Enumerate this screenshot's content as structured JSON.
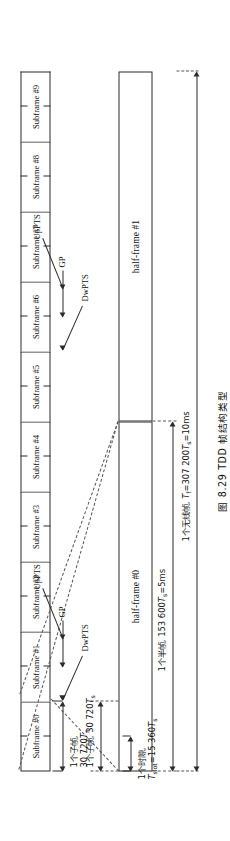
{
  "figure": {
    "caption_number": "图 8.29",
    "caption_title": "TDD 帧结构类型",
    "caption_full": "图 8.29  TDD 帧结构类型"
  },
  "dimensions": {
    "radio_frame": {
      "name_cn": "1个无线帧",
      "value": "Tf=307 200Ts=10ms",
      "value_prefix": "T",
      "value_sub": "f",
      "value_rest": "=307 200",
      "unit_sym": "T",
      "unit_sub": "s",
      "unit_tail": "=10ms",
      "full": "1个无线帧,Tf=307 200Ts=10ms"
    },
    "half_frame": {
      "name_cn": "1个半帧",
      "value_rest": "153 600",
      "unit_sym": "T",
      "unit_sub": "s",
      "unit_tail": "=5ms",
      "full": "1个半帧,153 600Ts=5ms"
    },
    "slot": {
      "name_cn": "1个时隙",
      "value_prefix": "T",
      "value_sub": "slot",
      "value_rest": "=15 360",
      "unit_sym": "T",
      "unit_sub": "s",
      "full": "1个时隙,Tslot=15 360Ts"
    },
    "subframe_upper": {
      "name_cn": "1个子帧",
      "value_rest": "30 720",
      "unit_sym": "T",
      "unit_sub": "s",
      "full": "1个子帧,30 720Ts"
    },
    "subframe_lower": {
      "name_cn": "1个子帧",
      "value_rest": "30 720",
      "unit_sym": "T",
      "unit_sub": "s",
      "full": "1个子帧,30 720Ts"
    }
  },
  "halfframes": [
    {
      "label": "half-frame #0"
    },
    {
      "label": "half-frame #1"
    }
  ],
  "subframes": [
    {
      "label": "Subframe #0"
    },
    {
      "label": "Subframe #1"
    },
    {
      "label": "Subframe #2"
    },
    {
      "label": "Subframe #3"
    },
    {
      "label": "Subframe #4"
    },
    {
      "label": "Subframe #5"
    },
    {
      "label": "Subframe #6"
    },
    {
      "label": "Subframe #7"
    },
    {
      "label": "Subframe #8"
    },
    {
      "label": "Subframe #9"
    }
  ],
  "special_fields": {
    "first_group": {
      "dwpts": "DwPTS",
      "gp": "GP",
      "uppts": "UpPTS"
    },
    "second_group": {
      "dwpts": "DwPTS",
      "gp": "GP",
      "uppts": "UpPTS"
    }
  },
  "colors": {
    "ink": "#2b2b2b",
    "text": "#111111",
    "dash": "#555555",
    "paper": "#ffffff"
  }
}
